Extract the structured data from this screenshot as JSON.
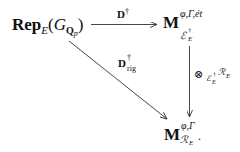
{
  "diagram": {
    "type": "commutative-diagram",
    "nodes": {
      "source": {
        "main": "Rep",
        "sub": "E",
        "paren_open": "(",
        "group": "G",
        "group_sub": "Q",
        "group_sub_sub": "p",
        "paren_close": ")"
      },
      "top_right": {
        "main": "M",
        "sup": "φ,Γ,ét",
        "sub_ring": "ℰ",
        "sub_ring_sup": "†",
        "sub_ring_sub": "E"
      },
      "bottom_right": {
        "main": "M",
        "sup": "φ,Γ",
        "sub_ring": "ℛ",
        "sub_ring_sub": "E",
        "trailing": "."
      }
    },
    "arrows": {
      "horizontal": {
        "from": "source",
        "to": "top_right",
        "label_main": "D",
        "label_sup": "†"
      },
      "diagonal": {
        "from": "source",
        "to": "bottom_right",
        "label_main": "D",
        "label_sup": "†",
        "label_sub": "rig"
      },
      "vertical": {
        "from": "top_right",
        "to": "bottom_right",
        "label_op": "⊗",
        "label_sub_ring": "ℰ",
        "label_sub_ring_sup": "†",
        "label_sub_ring_sub": "E",
        "label_ring": "ℛ",
        "label_ring_sub": "E"
      }
    },
    "colors": {
      "ink": "#111111",
      "arrow": "#333333",
      "background": "#ffffff"
    }
  }
}
